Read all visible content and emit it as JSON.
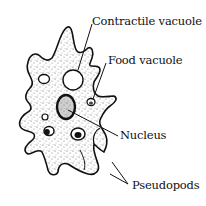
{
  "diagram": {
    "labels": [
      {
        "id": "contractile-vacuole",
        "text": "Contractile vacuole",
        "x": 92,
        "y": 16
      },
      {
        "id": "food-vacuole",
        "text": "Food vacuole",
        "x": 108,
        "y": 55
      },
      {
        "id": "nucleus",
        "text": "Nucleus",
        "x": 120,
        "y": 130
      },
      {
        "id": "pseudopods",
        "text": "Pseudopods",
        "x": 132,
        "y": 180
      }
    ],
    "colors": {
      "ink": "#111111",
      "background": "#ffffff",
      "stipple": "#555555"
    }
  }
}
